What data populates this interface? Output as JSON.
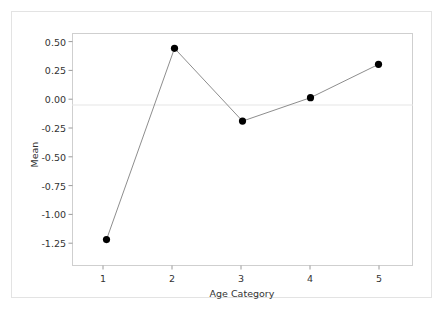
{
  "chart_data": {
    "type": "line",
    "title": "",
    "subtitle": "",
    "xlabel": "Age Category",
    "ylabel": "Mean",
    "categories": [
      "1",
      "2",
      "3",
      "4",
      "5"
    ],
    "values": [
      -1.09,
      0.46,
      -0.13,
      0.06,
      0.33
    ],
    "series": [
      {
        "name": "Mean",
        "values": [
          -1.09,
          0.46,
          -0.13,
          0.06,
          0.33
        ]
      }
    ],
    "xlim": [
      0.5,
      5.5
    ],
    "ylim": [
      -1.3,
      0.58
    ],
    "yticks": [
      0.5,
      0.25,
      0.0,
      -0.25,
      -0.5,
      -0.75,
      -1.0,
      -1.25
    ],
    "ytick_labels": [
      "0.50",
      "0.25",
      "0.00",
      "-0.25",
      "-0.50",
      "-0.75",
      "-1.00",
      "-1.25"
    ],
    "xtick_labels": [
      "1",
      "2",
      "3",
      "4",
      "5"
    ],
    "grid": false,
    "reference_line": 0.0,
    "legend": false,
    "legend_position": "none",
    "marker": "filled-circle",
    "marker_color": "#000000",
    "line_color": "#808080",
    "frame_color": "#cccccc",
    "gridline_color": "#eeeeee",
    "annotations": []
  },
  "axes": {
    "y_tick_labels": [
      "0.50",
      "0.25",
      "0.00",
      "-0.25",
      "-0.50",
      "-0.75",
      "-1.00",
      "-1.25"
    ],
    "x_tick_labels": [
      "1",
      "2",
      "3",
      "4",
      "5"
    ],
    "y_axis_title": "Mean",
    "x_axis_title": "Age Category"
  }
}
